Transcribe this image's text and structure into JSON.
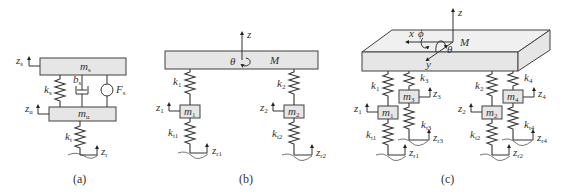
{
  "figure": {
    "panels": [
      {
        "id": "a",
        "caption": "(a)",
        "labels": {
          "sprung_mass": "m",
          "sprung_mass_sub": "s",
          "unsprung_mass": "m",
          "unsprung_mass_sub": "u",
          "suspension_spring": "k",
          "suspension_spring_sub": "s",
          "damper": "b",
          "damper_sub": "s",
          "actuator_force": "F",
          "actuator_force_sub": "s",
          "tire_spring": "k",
          "tire_spring_sub": "t",
          "z_sprung": "z",
          "z_sprung_sub": "s",
          "z_unsprung": "z",
          "z_unsprung_sub": "u",
          "z_road": "z",
          "z_road_sub": "r"
        }
      },
      {
        "id": "b",
        "caption": "(b)",
        "labels": {
          "body_mass": "M",
          "pitch": "θ",
          "z_axis": "z",
          "k1": "k",
          "k1_sub": "1",
          "k2": "k",
          "k2_sub": "2",
          "m1": "m",
          "m1_sub": "1",
          "m2": "m",
          "m2_sub": "2",
          "kt1": "k",
          "kt1_sub": "t1",
          "kt2": "k",
          "kt2_sub": "t2",
          "z1": "z",
          "z1_sub": "1",
          "z2": "z",
          "z2_sub": "2",
          "zr1": "z",
          "zr1_sub": "r1",
          "zr2": "z",
          "zr2_sub": "r2"
        }
      },
      {
        "id": "c",
        "caption": "(c)",
        "labels": {
          "body_mass": "M",
          "x_axis": "x",
          "y_axis": "y",
          "z_axis": "z",
          "roll": "ϕ",
          "pitch": "θ",
          "k1": "k",
          "k1_sub": "1",
          "k2": "k",
          "k2_sub": "2",
          "k3": "k",
          "k3_sub": "3",
          "k4": "k",
          "k4_sub": "4",
          "m1": "m",
          "m1_sub": "1",
          "m2": "m",
          "m2_sub": "2",
          "m3": "m",
          "m3_sub": "3",
          "m4": "m",
          "m4_sub": "4",
          "kt1": "k",
          "kt1_sub": "t1",
          "kt2": "k",
          "kt2_sub": "t2",
          "kt3": "k",
          "kt3_sub": "t3",
          "kt4": "k",
          "kt4_sub": "t4",
          "z1": "z",
          "z1_sub": "1",
          "z2": "z",
          "z2_sub": "2",
          "z3": "z",
          "z3_sub": "3",
          "z4": "z",
          "z4_sub": "4",
          "zr1": "z",
          "zr1_sub": "r1",
          "zr2": "z",
          "zr2_sub": "r2",
          "zr3": "z",
          "zr3_sub": "r3",
          "zr4": "z",
          "zr4_sub": "r4"
        }
      }
    ]
  }
}
